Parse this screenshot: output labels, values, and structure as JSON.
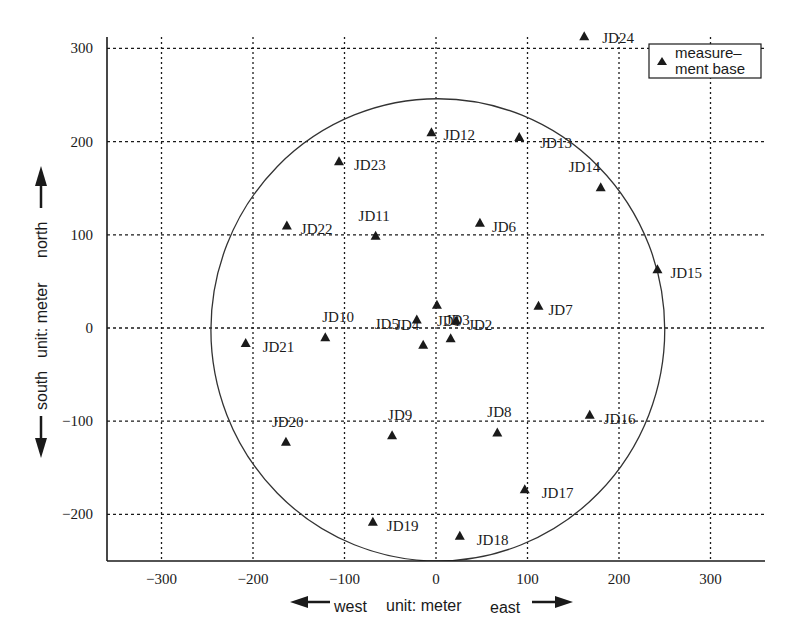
{
  "chart_data": {
    "type": "scatter",
    "title": "",
    "xlabel": {
      "west": "west",
      "unit": "unit: meter",
      "east": "east"
    },
    "ylabel": {
      "south": "south",
      "unit": "unit: meter",
      "north": "north"
    },
    "xlim": [
      -350,
      370
    ],
    "ylim": [
      -250,
      310
    ],
    "x_ticks": [
      -300,
      -200,
      -100,
      0,
      100,
      200,
      300
    ],
    "y_ticks": [
      -200,
      -100,
      0,
      100,
      200,
      300
    ],
    "x_tick_labels": [
      "−300",
      "−200",
      "−100",
      "0",
      "100",
      "200",
      "300"
    ],
    "y_tick_labels": [
      "−200",
      "−100",
      "0",
      "100",
      "200",
      "300"
    ],
    "grid": true,
    "grid_style": "dotted",
    "legend": {
      "position": "upper right",
      "entries": [
        {
          "marker": "triangle",
          "label_line1": "measure–",
          "label_line2": "ment base"
        }
      ]
    },
    "circle": {
      "cx": 2,
      "cy": -2,
      "r": 248
    },
    "series": [
      {
        "name": "measurement base",
        "marker": "triangle",
        "points": [
          {
            "label": "JD1",
            "x": 1,
            "y": 25,
            "lx": 0,
            "ly": 16,
            "anchor": "start"
          },
          {
            "label": "JD2",
            "x": 22,
            "y": 8,
            "lx": 12,
            "ly": 4,
            "anchor": "start"
          },
          {
            "label": "JD3",
            "x": 16,
            "y": -11,
            "lx": -5,
            "ly": -18,
            "anchor": "start"
          },
          {
            "label": "JD4",
            "x": -14,
            "y": -18,
            "lx": -28,
            "ly": -20,
            "anchor": "start"
          },
          {
            "label": "JD5",
            "x": -21,
            "y": 9,
            "lx": -42,
            "ly": 4,
            "anchor": "start"
          },
          {
            "label": "JD6",
            "x": 48,
            "y": 113,
            "lx": 12,
            "ly": 4,
            "anchor": "start"
          },
          {
            "label": "JD7",
            "x": 112,
            "y": 24,
            "lx": 10,
            "ly": 4,
            "anchor": "start"
          },
          {
            "label": "JD8",
            "x": 67,
            "y": -112,
            "lx": -10,
            "ly": -20,
            "anchor": "start"
          },
          {
            "label": "JD9",
            "x": -48,
            "y": -115,
            "lx": -4,
            "ly": -20,
            "anchor": "start"
          },
          {
            "label": "JD10",
            "x": -121,
            "y": -10,
            "lx": -3,
            "ly": -20,
            "anchor": "start"
          },
          {
            "label": "JD11",
            "x": -66,
            "y": 99,
            "lx": -17,
            "ly": -20,
            "anchor": "start"
          },
          {
            "label": "JD12",
            "x": -5,
            "y": 210,
            "lx": 12,
            "ly": 3,
            "anchor": "start"
          },
          {
            "label": "JD13",
            "x": 91,
            "y": 205,
            "lx": 21,
            "ly": 6,
            "anchor": "start"
          },
          {
            "label": "JD14",
            "x": 180,
            "y": 151,
            "lx": -32,
            "ly": -20,
            "anchor": "start"
          },
          {
            "label": "JD15",
            "x": 242,
            "y": 63,
            "lx": 13,
            "ly": 4,
            "anchor": "start"
          },
          {
            "label": "JD16",
            "x": 168,
            "y": -93,
            "lx": 14,
            "ly": 4,
            "anchor": "start"
          },
          {
            "label": "JD17",
            "x": 97,
            "y": -173,
            "lx": 17,
            "ly": 4,
            "anchor": "start"
          },
          {
            "label": "JD18",
            "x": 26,
            "y": -223,
            "lx": 17,
            "ly": 4,
            "anchor": "start"
          },
          {
            "label": "JD19",
            "x": -69,
            "y": -208,
            "lx": 14,
            "ly": 4,
            "anchor": "start"
          },
          {
            "label": "JD20",
            "x": -164,
            "y": -122,
            "lx": -14,
            "ly": -20,
            "anchor": "start"
          },
          {
            "label": "JD21",
            "x": -208,
            "y": -16,
            "lx": 17,
            "ly": 4,
            "anchor": "start"
          },
          {
            "label": "JD22",
            "x": -163,
            "y": 110,
            "lx": 14,
            "ly": 4,
            "anchor": "start"
          },
          {
            "label": "JD23",
            "x": -106,
            "y": 179,
            "lx": 15,
            "ly": 4,
            "anchor": "start"
          },
          {
            "label": "JD24",
            "x": 162,
            "y": 313,
            "lx": 18,
            "ly": 2,
            "anchor": "start"
          }
        ]
      }
    ]
  },
  "colors": {
    "ink": "#1a1a1a",
    "grid": "#1a1a1a",
    "background": "#ffffff"
  }
}
